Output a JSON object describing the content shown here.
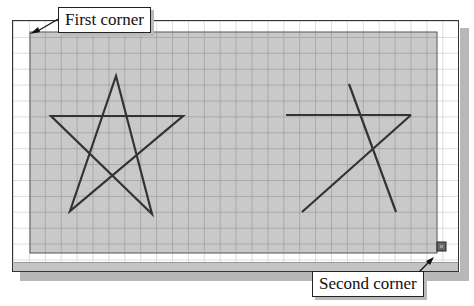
{
  "callouts": {
    "first_corner": "First corner",
    "second_corner": "Second corner"
  },
  "colors": {
    "selection_fill": "#c9c9c9",
    "grid_line": "#9a9a9a",
    "stroke": "#333333",
    "background": "#ffffff"
  },
  "drawing": {
    "grid_spacing_px": 16,
    "selection_window": {
      "first_corner": [
        30,
        32
      ],
      "second_corner": [
        437,
        253
      ]
    },
    "objects": [
      {
        "type": "star",
        "complete": true,
        "points": [
          [
            116,
            76
          ],
          [
            152,
            214
          ],
          [
            51,
            116
          ],
          [
            183,
            116
          ],
          [
            70,
            211
          ]
        ]
      },
      {
        "type": "partial-star",
        "complete": false,
        "segments": [
          [
            [
              349,
              84
            ],
            [
              396,
              212
            ]
          ],
          [
            [
              286,
              115
            ],
            [
              411,
              115
            ]
          ],
          [
            [
              411,
              115
            ],
            [
              302,
              212
            ]
          ]
        ]
      }
    ],
    "grip_marker": [
      441,
      246
    ]
  }
}
